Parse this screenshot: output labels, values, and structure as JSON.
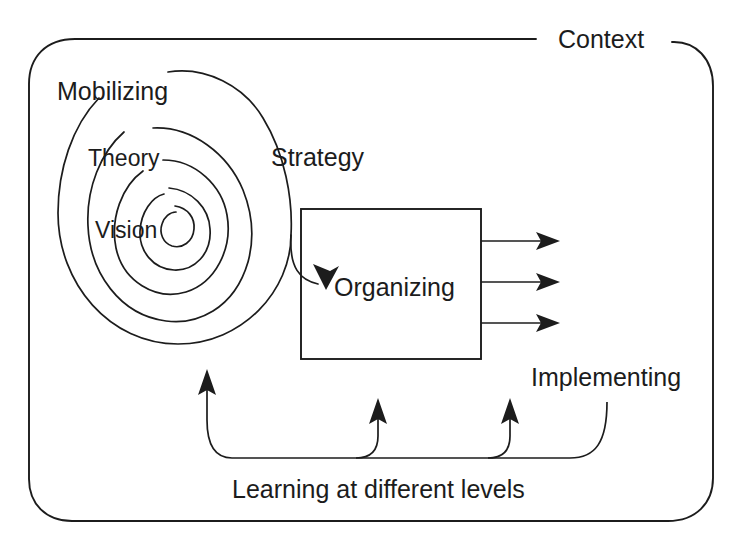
{
  "diagram": {
    "title": "Context",
    "type": "process-spiral-diagram",
    "colors": {
      "stroke": "#1c1c1c",
      "background": "#ffffff"
    },
    "labels": {
      "context": "Context",
      "mobilizing": "Mobilizing",
      "theory": "Theory",
      "vision": "Vision",
      "strategy": "Strategy",
      "organizing": "Organizing",
      "implementing": "Implementing",
      "learning": "Learning at different levels"
    },
    "elements": {
      "outer_boundary": "rounded-rectangle",
      "spiral_turns": 4,
      "output_arrow_count": 3,
      "feedback_arrow_count": 3
    }
  }
}
